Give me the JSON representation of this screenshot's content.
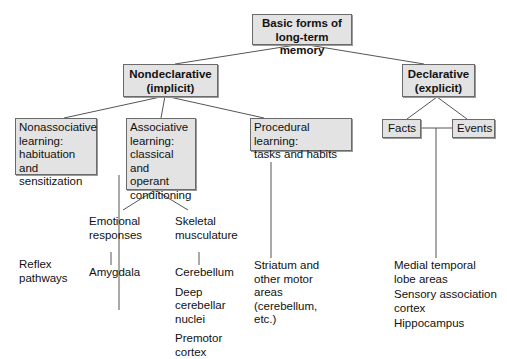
{
  "root": {
    "label_lines": [
      "Basic forms of",
      "long-term memory"
    ]
  },
  "nondeclarative": {
    "label_lines": [
      "Nondeclarative",
      "(implicit)"
    ],
    "children": [
      {
        "label_lines": [
          "Nonassociative",
          "learning:",
          "habituation and",
          "sensitization"
        ],
        "structures": [
          [
            "Reflex",
            "pathways"
          ]
        ]
      },
      {
        "label_lines": [
          "Associative",
          "learning:",
          "classical and",
          "operant",
          "conditioning"
        ],
        "branches": [
          {
            "label_lines": [
              "Emotional",
              "responses"
            ],
            "structures": [
              [
                "Amygdala"
              ]
            ]
          },
          {
            "label_lines": [
              "Skeletal",
              "musculature"
            ],
            "structures": [
              [
                "Cerebellum"
              ],
              [
                "Deep",
                "cerebellar",
                "nuclei"
              ],
              [
                "Premotor",
                "cortex"
              ]
            ]
          }
        ]
      },
      {
        "label_lines": [
          "Procedural learning:",
          "tasks and habits"
        ],
        "structures": [
          [
            "Striatum and",
            "other motor",
            "areas",
            "(cerebellum,",
            "etc.)"
          ]
        ]
      }
    ]
  },
  "declarative": {
    "label_lines": [
      "Declarative",
      "(explicit)"
    ],
    "children": [
      {
        "label": "Facts"
      },
      {
        "label": "Events"
      }
    ],
    "structures": [
      [
        "Medial temporal",
        "lobe areas"
      ],
      [
        "Sensory association",
        "cortex"
      ],
      [
        "Hippocampus"
      ]
    ]
  }
}
